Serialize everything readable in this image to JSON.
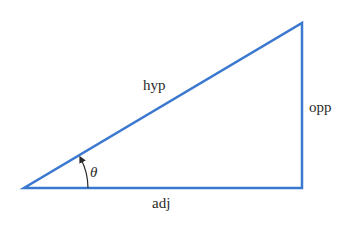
{
  "diagram": {
    "stroke_color": "#3b78d0",
    "label_color": "#2a2a2a",
    "vertices": {
      "angle_vertex": [
        24,
        188
      ],
      "right_angle_vertex": [
        302,
        188
      ],
      "top_vertex": [
        302,
        23
      ]
    },
    "labels": {
      "hypotenuse": "hyp",
      "opposite": "opp",
      "adjacent": "adj",
      "angle": "θ"
    }
  }
}
